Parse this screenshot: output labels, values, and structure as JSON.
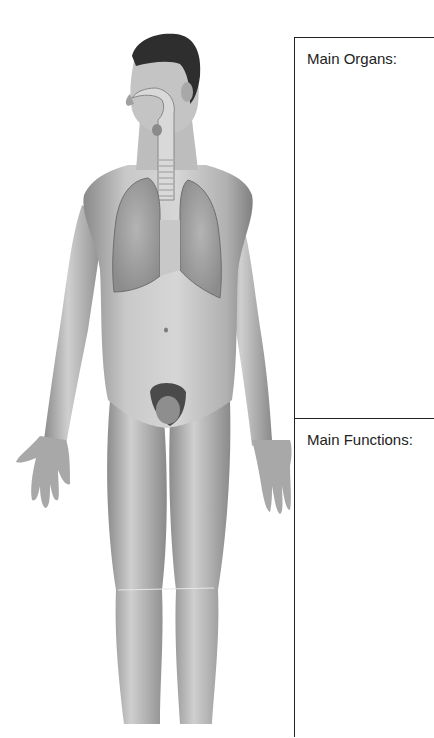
{
  "diagram": {
    "figure": {
      "description": "Anterior view of male human body with respiratory organs (nasal cavity, pharynx, trachea, lungs) highlighted",
      "visible_structures": [
        "nasal-cavity",
        "pharynx",
        "larynx",
        "trachea",
        "left-lung",
        "right-lung"
      ]
    },
    "worksheet": {
      "sections": [
        {
          "label": "Main Organs:",
          "answer": ""
        },
        {
          "label": "Main Functions:",
          "answer": ""
        }
      ]
    },
    "colors": {
      "border": "#222222",
      "text": "#222222",
      "skin_mid": "#b8b8b8",
      "skin_dark": "#7a7a7a",
      "hair": "#2a2a2a",
      "lung": "#9a9a9a"
    }
  }
}
